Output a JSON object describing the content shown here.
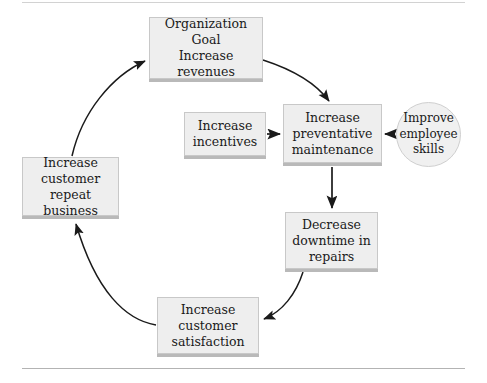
{
  "diagram": {
    "type": "cycle-flow-diagram",
    "colors": {
      "node_fill": "#eeeeee",
      "node_border": "#c8c8c8",
      "node_shadow": "#b9b9b9",
      "ellipse_fill": "#f0f0f0",
      "edge_stroke": "#1a1a1a",
      "rule": "#bfbfbf",
      "background": "#ffffff",
      "text": "#1a1a1a"
    },
    "nodes": [
      {
        "id": "goal",
        "shape": "rect",
        "label": "Organization\nGoal\nIncrease revenues"
      },
      {
        "id": "incentives",
        "shape": "rect",
        "label": "Increase\nincentives"
      },
      {
        "id": "preventative",
        "shape": "rect",
        "label": "Increase\npreventative\nmaintenance"
      },
      {
        "id": "skills",
        "shape": "ellipse",
        "label": "Improve\nemployee\nskills"
      },
      {
        "id": "downtime",
        "shape": "rect",
        "label": "Decrease\ndowntime in\nrepairs"
      },
      {
        "id": "satisfaction",
        "shape": "rect",
        "label": "Increase\ncustomer\nsatisfaction"
      },
      {
        "id": "repeat",
        "shape": "rect",
        "label": "Increase\ncustomer repeat\nbusiness"
      }
    ],
    "edges": [
      {
        "id": "goal-to-preventative",
        "from": "goal",
        "to": "preventative",
        "style": "curved"
      },
      {
        "id": "incentives-to-preventative",
        "from": "incentives",
        "to": "preventative",
        "style": "straight"
      },
      {
        "id": "skills-to-preventative",
        "from": "skills",
        "to": "preventative",
        "style": "straight"
      },
      {
        "id": "preventative-to-downtime",
        "from": "preventative",
        "to": "downtime",
        "style": "straight"
      },
      {
        "id": "downtime-to-satisfaction",
        "from": "downtime",
        "to": "satisfaction",
        "style": "curved"
      },
      {
        "id": "satisfaction-to-repeat",
        "from": "satisfaction",
        "to": "repeat",
        "style": "curved"
      },
      {
        "id": "repeat-to-goal",
        "from": "repeat",
        "to": "goal",
        "style": "curved"
      }
    ]
  }
}
